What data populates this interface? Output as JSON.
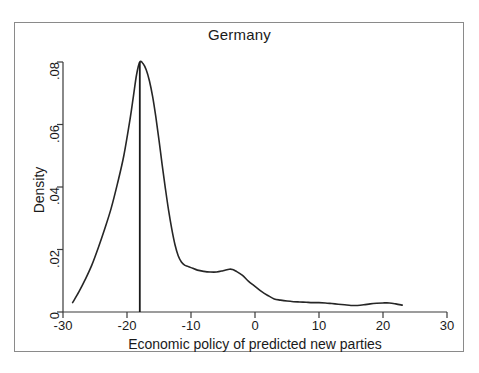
{
  "figure": {
    "title": "Germany",
    "background": "#ffffff",
    "frame_color": "#8a8a8a",
    "line_color": "#262626"
  },
  "axes": {
    "x": {
      "label": "Economic policy of predicted new parties",
      "ticks": [
        "-30",
        "-20",
        "-10",
        "0",
        "10",
        "20",
        "30"
      ],
      "tick_values": [
        -30,
        -20,
        -10,
        0,
        10,
        20,
        30
      ],
      "range": [
        -30,
        30
      ]
    },
    "y": {
      "label": "Density",
      "ticks": [
        "0",
        ".02",
        ".04",
        ".06",
        ".08"
      ],
      "tick_values": [
        0,
        0.02,
        0.04,
        0.06,
        0.08
      ],
      "range": [
        0,
        0.08
      ]
    }
  },
  "chart_data": {
    "type": "line",
    "title": "Germany",
    "xlabel": "Economic policy of predicted new parties",
    "ylabel": "Density",
    "xlim": [
      -30,
      30
    ],
    "ylim": [
      0,
      0.08
    ],
    "grid": false,
    "legend": null,
    "series": [
      {
        "name": "Kernel density of economic policy",
        "x": [
          -28.5,
          -27.5,
          -26.5,
          -25.5,
          -24.5,
          -23.5,
          -22.5,
          -21.5,
          -20.5,
          -19.5,
          -19.0,
          -18.5,
          -18.0,
          -17.5,
          -17.0,
          -16.5,
          -16.0,
          -15.5,
          -15.0,
          -14.5,
          -14.0,
          -13.5,
          -13.0,
          -12.5,
          -12.0,
          -11.5,
          -11.0,
          -10.5,
          -10.0,
          -9.0,
          -8.0,
          -7.0,
          -6.0,
          -5.0,
          -4.0,
          -3.5,
          -3.0,
          -2.0,
          -1.0,
          0.0,
          1.0,
          2.0,
          3.0,
          4.0,
          5.0,
          6.0,
          7.0,
          8.0,
          9.0,
          10.0,
          11.0,
          12.0,
          13.0,
          14.0,
          15.0,
          16.0,
          17.0,
          18.0,
          19.0,
          20.0,
          21.0,
          22.0,
          23.0
        ],
        "y": [
          0.003,
          0.0065,
          0.0105,
          0.015,
          0.0205,
          0.0265,
          0.033,
          0.041,
          0.05,
          0.062,
          0.069,
          0.076,
          0.08,
          0.0795,
          0.0775,
          0.074,
          0.069,
          0.0625,
          0.055,
          0.047,
          0.0395,
          0.0325,
          0.0265,
          0.0215,
          0.018,
          0.016,
          0.015,
          0.0146,
          0.0142,
          0.0134,
          0.013,
          0.0128,
          0.0128,
          0.0132,
          0.0137,
          0.0136,
          0.0131,
          0.0118,
          0.0098,
          0.0082,
          0.0066,
          0.0053,
          0.0042,
          0.0038,
          0.0035,
          0.0033,
          0.0032,
          0.0031,
          0.003,
          0.003,
          0.0029,
          0.0027,
          0.0025,
          0.0023,
          0.0021,
          0.0021,
          0.0023,
          0.0026,
          0.0028,
          0.0029,
          0.0029,
          0.0026,
          0.0022
        ]
      }
    ],
    "annotations": [
      {
        "type": "vline",
        "name": "mean-reference-line",
        "x": -18.0,
        "y_from": 0.0,
        "y_to": 0.08
      }
    ]
  }
}
